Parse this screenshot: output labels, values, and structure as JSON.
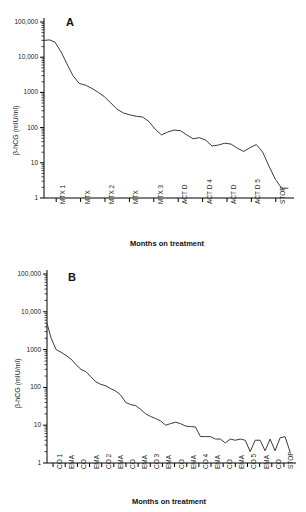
{
  "figure": {
    "panels": [
      {
        "id": "A",
        "letter": "A",
        "ylabel": "β-hCG (mIU/ml)",
        "xlabel": "Months on treatment",
        "chart_data": {
          "type": "line",
          "title": "A",
          "xlabel": "Months on treatment",
          "ylabel": "β-hCG (mIU/ml)",
          "yscale": "log",
          "ylim": [
            1,
            100000
          ],
          "ytick_labels": [
            "1",
            "10",
            "100",
            "1000",
            "10,000",
            "100,000"
          ],
          "ytick_values": [
            1,
            10,
            100,
            1000,
            10000,
            100000
          ],
          "grid": false,
          "legend": "none",
          "xtick_labels": [
            "MTX 1",
            "MTX",
            "MTX 2",
            "MTX",
            "MTX 3",
            "ACT D",
            "ACT D 4",
            "ACT D",
            "ACT D 5",
            "STOP"
          ],
          "x": [
            0,
            0.6,
            1.2,
            1.9,
            2.6,
            3.2,
            3.9,
            4.6,
            5.3,
            6.0,
            6.7,
            7.4,
            8.1,
            8.8,
            9.5,
            10.2,
            10.9,
            11.6,
            12.3,
            13.0,
            13.7,
            14.4,
            15.1,
            15.8,
            16.5,
            17.2,
            17.9,
            18.6,
            19.3,
            20.0,
            20.7,
            21.4,
            22.1,
            22.8,
            23.5,
            24.2,
            24.9,
            25.6,
            26.3,
            27.0
          ],
          "values": [
            30000,
            31000,
            27000,
            14000,
            6000,
            3000,
            1800,
            1600,
            1300,
            1000,
            750,
            500,
            330,
            260,
            230,
            210,
            200,
            150,
            90,
            62,
            75,
            85,
            82,
            62,
            48,
            52,
            44,
            30,
            32,
            36,
            34,
            26,
            21,
            27,
            33,
            20,
            8,
            3.4,
            1.9,
            1.9
          ]
        }
      },
      {
        "id": "B",
        "letter": "B",
        "ylabel": "β-hCG (mIU/ml)",
        "xlabel": "Months on treatment",
        "chart_data": {
          "type": "line",
          "title": "B",
          "xlabel": "Months on treatment",
          "ylabel": "β-hCG (mIU/ml)",
          "yscale": "log",
          "ylim": [
            1,
            100000
          ],
          "ytick_labels": [
            "1",
            "10",
            "100",
            "1000",
            "10,000",
            "100,000"
          ],
          "ytick_values": [
            1,
            10,
            100,
            1000,
            10000,
            100000
          ],
          "grid": false,
          "legend": "none",
          "xtick_labels": [
            "CO 1",
            "EMA",
            "CO",
            "EMA",
            "CO 2",
            "EMA",
            "CO",
            "EMA",
            "CO 3",
            "EMA",
            "CO",
            "EMA",
            "CO 4",
            "EMA",
            "CO",
            "EMA",
            "CO 5",
            "EMA",
            "CO",
            "STOP"
          ],
          "x": [
            0,
            0.5,
            1.1,
            1.7,
            2.3,
            2.9,
            3.5,
            4.1,
            4.7,
            5.3,
            5.9,
            6.5,
            7.1,
            7.7,
            8.3,
            8.9,
            9.5,
            10.1,
            10.7,
            11.3,
            11.9,
            12.5,
            13.1,
            13.7,
            14.3,
            14.9,
            15.5,
            16.1,
            16.7,
            17.3,
            17.9,
            18.5,
            19.1,
            19.7,
            20.3,
            20.9,
            21.5,
            22.1,
            22.7,
            23.3,
            23.9,
            24.5,
            25.1,
            25.7,
            26.3,
            26.9,
            27.5,
            28.1,
            28.7,
            29.3
          ],
          "values": [
            5000,
            2000,
            1000,
            850,
            700,
            560,
            400,
            300,
            260,
            190,
            140,
            120,
            110,
            92,
            80,
            62,
            40,
            35,
            33,
            26,
            20,
            17,
            15,
            13,
            10,
            11,
            12,
            11,
            9.5,
            9.2,
            9.0,
            5.0,
            5.0,
            5.0,
            4.3,
            4.3,
            3.4,
            4.3,
            4.0,
            4.3,
            4.0,
            2.0,
            4.0,
            4.0,
            2.1,
            4.3,
            2.1,
            4.6,
            5.0,
            2.0
          ]
        }
      }
    ]
  }
}
